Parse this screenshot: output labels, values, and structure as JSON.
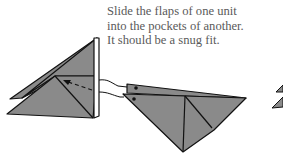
{
  "caption": {
    "lines": [
      "Slide the flaps of one unit",
      "into the pockets of another.",
      "It should be a snug fit."
    ]
  },
  "colors": {
    "paper_fill": "#8a8a8a",
    "outline": "#111111",
    "text": "#5a5a5a",
    "background": "#ffffff"
  },
  "diagram": {
    "left_unit": "origami-unit-receiving",
    "right_unit": "origami-unit-inserting",
    "arrow": "dashed-insertion-arrow"
  }
}
